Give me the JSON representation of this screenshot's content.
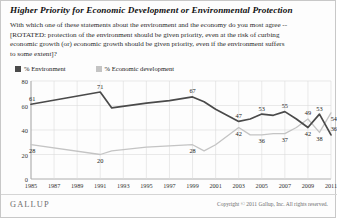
{
  "title": "Higher Priority for Economic Development or Environmental Protection",
  "subtitle_lines": [
    "With which one of these statements about the environment and the economy do you most agree --",
    "[ROTATED: protection of the environment should be given priority, even at the risk of curbing",
    "economic growth (or) economic growth should be given priority, even if the environment suffers",
    "to some extent]?"
  ],
  "legend": [
    {
      "label": "% Environment",
      "color": "#4a4a4a"
    },
    {
      "label": "% Economic development",
      "color": "#c4c4c4"
    }
  ],
  "footer": {
    "brand": "GALLUP",
    "copyright": "Copyright © 2011 Gallup, Inc. All rights reserved."
  },
  "chart_data": {
    "type": "line",
    "title": "Higher Priority for Economic Development or Environmental Protection",
    "xlabel": "",
    "ylabel": "",
    "ylim": [
      0,
      80
    ],
    "yticks": [
      0,
      20,
      40,
      60,
      80
    ],
    "xticks": [
      "1985",
      "1987",
      "1989",
      "1991",
      "1993",
      "1995",
      "1997",
      "1999",
      "2001",
      "2003",
      "2005",
      "2007",
      "2009",
      "2011"
    ],
    "grid": true,
    "legend_position": "top-left",
    "x": [
      1985,
      1991,
      1992,
      1995,
      1997,
      1999,
      2000,
      2001,
      2003,
      2004,
      2005,
      2006,
      2007,
      2008,
      2009,
      2010,
      2011
    ],
    "series": [
      {
        "name": "% Environment",
        "color": "#4a4a4a",
        "values": [
          61,
          71,
          58,
          62,
          64,
          67,
          63,
          57,
          47,
          49,
          53,
          52,
          55,
          49,
          42,
          53,
          36
        ],
        "labels": [
          {
            "x": 1985,
            "value": 61
          },
          {
            "x": 1991,
            "value": 71
          },
          {
            "x": 1999,
            "value": 67
          },
          {
            "x": 2003,
            "value": 47
          },
          {
            "x": 2005,
            "value": 53
          },
          {
            "x": 2007,
            "value": 55
          },
          {
            "x": 2009,
            "value": 49
          },
          {
            "x": 2010,
            "value": 53
          },
          {
            "x": 2011,
            "value": 36
          }
        ]
      },
      {
        "name": "% Economic development",
        "color": "#c4c4c4",
        "values": [
          28,
          20,
          23,
          26,
          27,
          28,
          23,
          28,
          42,
          36,
          36,
          37,
          37,
          42,
          49,
          38,
          54
        ],
        "labels": [
          {
            "x": 1985,
            "value": 28
          },
          {
            "x": 1991,
            "value": 20
          },
          {
            "x": 1999,
            "value": 28
          },
          {
            "x": 2003,
            "value": 42
          },
          {
            "x": 2005,
            "value": 36
          },
          {
            "x": 2007,
            "value": 37
          },
          {
            "x": 2009,
            "value": 42
          },
          {
            "x": 2010,
            "value": 38
          },
          {
            "x": 2011,
            "value": 54
          }
        ]
      }
    ]
  }
}
